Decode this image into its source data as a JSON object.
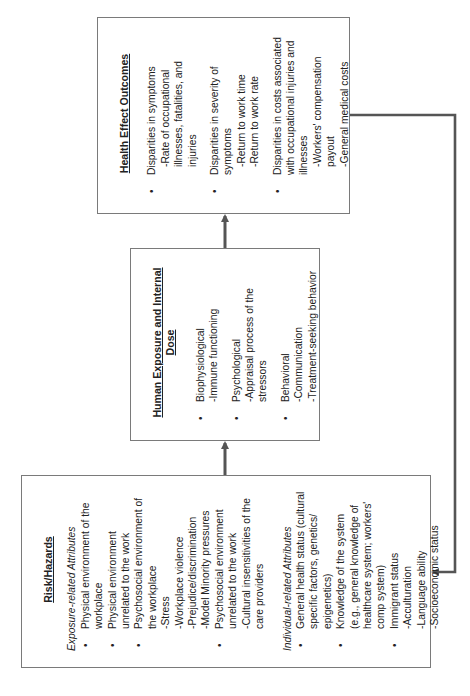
{
  "diagram": {
    "orientation": "rotated-90-ccw",
    "line_color": "#555555",
    "border_color": "#7a7a7a",
    "risk": {
      "title": "Risk/Hazards",
      "exposure_label": "Exposure-related Attributes",
      "exposure_items": [
        {
          "text": "Physical environment of the workplace",
          "subs": []
        },
        {
          "text": "Physical environment unrelated to the work",
          "subs": []
        },
        {
          "text": "Psychosocial environment of the workplace",
          "subs": [
            "-Stress",
            "-Workplace violence",
            "-Prejudice/discrimination",
            "-Model Minority pressures"
          ]
        },
        {
          "text": "Psychosocial environment unrelated to the work",
          "subs": [
            "-Cultural insensitivities of the care providers"
          ]
        }
      ],
      "individual_label": "Individual-related Attributes",
      "individual_items": [
        {
          "text": "General health status (cultural specific factors, genetics/ epigenetics)",
          "subs": []
        },
        {
          "text": "Knowledge of the system (e.g., general knowledge of healthcare system; workers' comp system)",
          "subs": []
        },
        {
          "text": "Immigrant status",
          "subs": [
            "-Acculturation",
            "-Language ability",
            "-Socioeconomic status"
          ]
        }
      ]
    },
    "exposure": {
      "title": "Human Exposure and Internal Dose",
      "items": [
        {
          "text": "Biophysiological",
          "subs": [
            "-Immune functioning"
          ]
        },
        {
          "text": "Psychological",
          "subs": [
            "-Appraisal process of the stressors"
          ]
        },
        {
          "text": "Behavioral",
          "subs": [
            "-Communication",
            "-Treatment-seeking behavior"
          ]
        }
      ]
    },
    "health": {
      "title": "Health Effect Outcomes",
      "items": [
        {
          "text": "Disparities in symptoms",
          "subs": [
            "-Rate of occupational illnesses, fatalities, and injuries"
          ]
        },
        {
          "text": "Disparities in severity of symptoms",
          "subs": [
            "-Return to work time",
            "-Return to work rate"
          ]
        },
        {
          "text": "Disparities in costs associated with occupational injuries and illnesses",
          "subs": [
            "-Workers' compensation payout",
            "-General medical costs"
          ]
        }
      ]
    },
    "arrows": [
      {
        "from": "Risk/Hazards",
        "to": "Human Exposure and Internal Dose"
      },
      {
        "from": "Human Exposure and Internal Dose",
        "to": "Health Effect Outcomes"
      },
      {
        "from": "Health Effect Outcomes",
        "to": "Risk/Hazards",
        "type": "feedback-loop"
      }
    ]
  }
}
